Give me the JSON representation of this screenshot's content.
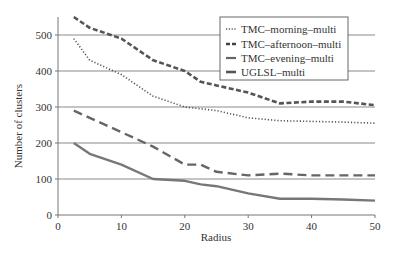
{
  "chart_data": {
    "type": "line",
    "title": "",
    "xlabel": "Radius",
    "ylabel": "Number of clusters",
    "xlim": [
      0,
      50
    ],
    "ylim": [
      0,
      550
    ],
    "xticks": [
      0,
      10,
      20,
      30,
      40,
      50
    ],
    "yticks": [
      0,
      100,
      200,
      300,
      400,
      500
    ],
    "grid": "horizontal",
    "legend_position": "upper right",
    "x": [
      2.5,
      5,
      10,
      15,
      20,
      22.5,
      25,
      30,
      35,
      40,
      45,
      50
    ],
    "series": [
      {
        "name": "TMC–morning–multi",
        "style": "dotted",
        "color": "#555555",
        "values": [
          490,
          430,
          390,
          330,
          300,
          295,
          290,
          270,
          262,
          260,
          258,
          255
        ]
      },
      {
        "name": "TMC–afternoon–multi",
        "style": "short-dash",
        "color": "#555555",
        "values": [
          550,
          520,
          490,
          430,
          400,
          370,
          360,
          340,
          310,
          315,
          315,
          305
        ]
      },
      {
        "name": "TMC–evening–multi",
        "style": "long-dash",
        "color": "#666666",
        "values": [
          290,
          270,
          230,
          190,
          140,
          140,
          120,
          110,
          115,
          110,
          110,
          110
        ]
      },
      {
        "name": "UGLSL–multi",
        "style": "solid",
        "color": "#777777",
        "values": [
          200,
          170,
          140,
          100,
          95,
          85,
          80,
          60,
          45,
          45,
          43,
          40
        ]
      }
    ]
  },
  "plot": {
    "x_axis_title": "Radius",
    "y_axis_title": "Number of clusters",
    "x_tick_labels": [
      "0",
      "10",
      "20",
      "30",
      "40",
      "50"
    ],
    "y_tick_labels": [
      "0",
      "100",
      "200",
      "300",
      "400",
      "500"
    ],
    "legend": [
      {
        "label": "TMC–morning–multi"
      },
      {
        "label": "TMC–afternoon–multi"
      },
      {
        "label": "TMC–evening–multi"
      },
      {
        "label": "UGLSL–multi"
      }
    ]
  }
}
